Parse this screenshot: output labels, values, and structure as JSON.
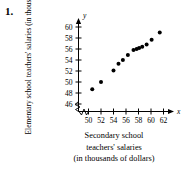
{
  "problem": {
    "number": "1."
  },
  "axis_titles": {
    "y": [
      "Elementary school",
      "teachers' salaries",
      "(in thousands of dollars)"
    ],
    "x": [
      "Secondary school",
      "teachers' salaries",
      "(in thousands of dollars)"
    ]
  },
  "axis_symbols": {
    "y": "y",
    "x": "x"
  },
  "colors": {
    "axis": "#000000",
    "point": "#000000",
    "text": "#000000",
    "background": "#ffffff"
  },
  "chart_data": {
    "type": "scatter",
    "title": "",
    "subtitle": "",
    "xlabel": "Secondary school teachers' salaries (in thousands of dollars)",
    "ylabel": "Elementary school teachers' salaries (in thousands of dollars)",
    "xlim": [
      48.8,
      63.5
    ],
    "ylim": [
      45.0,
      60.8
    ],
    "xticks": [
      50,
      52,
      54,
      56,
      58,
      60,
      62
    ],
    "yticks": [
      46,
      48,
      50,
      52,
      54,
      56,
      58,
      60
    ],
    "xtick_labels": [
      "50",
      "52",
      "54",
      "56",
      "58",
      "60",
      "62"
    ],
    "ytick_labels": [
      "46",
      "48",
      "50",
      "52",
      "54",
      "56",
      "58",
      "60"
    ],
    "grid": false,
    "legend": false,
    "axis_break_x": true,
    "axis_break_y": true,
    "series": [
      {
        "name": "teacher salaries",
        "marker": "filled-circle",
        "color": "#000000",
        "points": [
          {
            "x": 50.6,
            "y": 48.7
          },
          {
            "x": 52.0,
            "y": 50.0
          },
          {
            "x": 54.0,
            "y": 52.1
          },
          {
            "x": 54.8,
            "y": 53.3
          },
          {
            "x": 55.5,
            "y": 54.0
          },
          {
            "x": 56.3,
            "y": 54.9
          },
          {
            "x": 57.2,
            "y": 55.8
          },
          {
            "x": 57.7,
            "y": 56.0
          },
          {
            "x": 58.1,
            "y": 56.2
          },
          {
            "x": 58.6,
            "y": 56.4
          },
          {
            "x": 59.3,
            "y": 56.8
          },
          {
            "x": 60.1,
            "y": 57.7
          },
          {
            "x": 61.4,
            "y": 59.0
          }
        ]
      }
    ]
  }
}
